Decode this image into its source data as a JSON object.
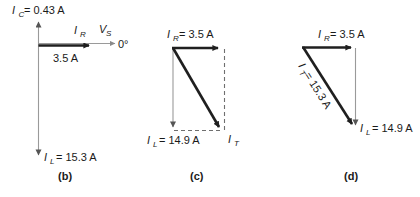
{
  "figure": {
    "title": "",
    "background_color": "#ffffff",
    "ink_color": "#1a1a1a",
    "axis_color": "#9a9a9a",
    "vector_color": "#1f1f1f",
    "panels": [
      {
        "key": "b",
        "caption": "(b)",
        "labels": {
          "ic": "I",
          "ic_sub": "C",
          "ic_value": "= 0.43 A",
          "ir": "I",
          "ir_sub": "R",
          "vs": "V",
          "vs_sub": "S",
          "angle": "0°",
          "ir_value": "3.5 A",
          "il": "I",
          "il_sub": "L",
          "il_value": "= 15.3 A"
        }
      },
      {
        "key": "c",
        "caption": "(c)",
        "labels": {
          "ir": "I",
          "ir_sub": "R",
          "ir_value": "= 3.5 A",
          "il": "I",
          "il_sub": "L",
          "il_value": "= 14.9 A",
          "it": "I",
          "it_sub": "T"
        }
      },
      {
        "key": "d",
        "caption": "(d)",
        "labels": {
          "ir": "I",
          "ir_sub": "R",
          "ir_value": "= 3.5 A",
          "it": "I",
          "it_sub": "T",
          "it_value": "= 15.3 A",
          "il": "I",
          "il_sub": "L",
          "il_value": "= 14.9 A"
        }
      }
    ]
  }
}
